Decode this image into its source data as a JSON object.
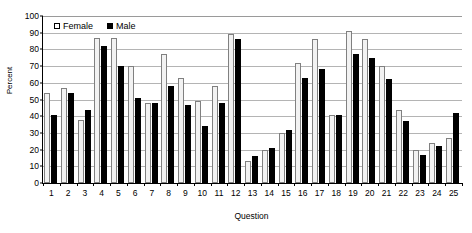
{
  "chart_data": {
    "type": "bar",
    "title": "",
    "xlabel": "Question",
    "ylabel": "Percent",
    "ylim": [
      0,
      100
    ],
    "ytick_step": 10,
    "yticks": [
      0,
      10,
      20,
      30,
      40,
      50,
      60,
      70,
      80,
      90,
      100
    ],
    "grid": true,
    "legend_position": "top-left inside plot",
    "categories": [
      "1",
      "2",
      "3",
      "4",
      "5",
      "6",
      "7",
      "8",
      "9",
      "10",
      "11",
      "12",
      "13",
      "14",
      "15",
      "16",
      "17",
      "18",
      "19",
      "20",
      "21",
      "22",
      "23",
      "24",
      "25"
    ],
    "series": [
      {
        "name": "Female",
        "color": "#f2f2f2",
        "values": [
          54,
          57,
          38,
          87,
          87,
          70,
          48,
          77,
          63,
          49,
          58,
          89,
          13,
          20,
          30,
          72,
          86,
          41,
          91,
          86,
          70,
          44,
          20,
          24,
          27
        ]
      },
      {
        "name": "Male",
        "color": "#000000",
        "values": [
          41,
          54,
          44,
          82,
          70,
          51,
          48,
          58,
          47,
          34,
          48,
          86,
          16,
          21,
          32,
          63,
          68,
          41,
          77,
          75,
          62,
          37,
          17,
          22,
          42
        ]
      }
    ]
  },
  "axis": {
    "y_title": "Percent",
    "x_title": "Question"
  },
  "legend": {
    "items": [
      {
        "label": "Female",
        "swatch": "open-square-swatch"
      },
      {
        "label": "Male",
        "swatch": "filled-square-swatch"
      }
    ]
  }
}
